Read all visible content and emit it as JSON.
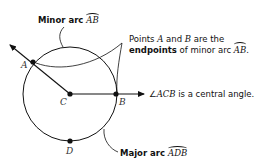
{
  "labels": {
    "minor_arc": {
      "prefix": "Minor arc ",
      "arc_name": "AB"
    },
    "endpoints": {
      "line1_pre": "Points ",
      "point_a": "A",
      "and": " and ",
      "point_b": "B",
      "line1_post": " are the",
      "line2_bold": "endpoints",
      "line2_mid": " of minor arc ",
      "arc_name": "AB",
      "line2_end": "."
    },
    "central_angle": {
      "angle_symbol": "∠",
      "angle_name": "ACB",
      "text": " is a central angle."
    },
    "major_arc": {
      "prefix": "Major arc ",
      "arc_name": "ADB"
    }
  },
  "points": {
    "A": "A",
    "B": "B",
    "C": "C",
    "D": "D"
  },
  "colors": {
    "stroke": "#111111",
    "background": "#ffffff"
  }
}
